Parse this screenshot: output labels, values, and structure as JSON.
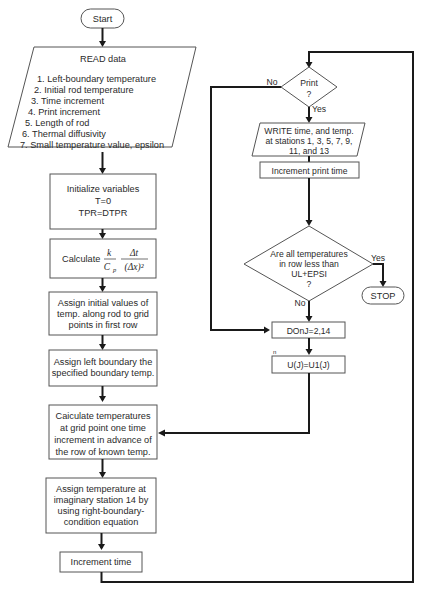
{
  "flowchart": {
    "start": "Start",
    "read": {
      "title": "READ data",
      "items": [
        "1.  Left-boundary temperature",
        "2.  Initial rod temperature",
        "3.  Time increment",
        "4.  Print increment",
        "5.  Length of rod",
        "6.  Thermal diffusivity",
        "7.  Small temperature value, epsilon"
      ]
    },
    "init": {
      "lines": [
        "Initialize variables",
        "T=0",
        "TPR=DTPR"
      ]
    },
    "calculate": {
      "label": "Calculate",
      "k": "k",
      "cp": "C",
      "cp_sub": "p",
      "dt": "Δt",
      "dx2": "(Δx)²"
    },
    "assign_initial": {
      "lines": [
        "Assign initial values of",
        "temp. along rod to grid",
        "points in first row"
      ]
    },
    "assign_left": {
      "lines": [
        "Assign left boundary the",
        "specified boundary temp."
      ]
    },
    "calc_temps": {
      "lines": [
        "Caiculate temperatures",
        "at grid point one time",
        "increment in advance of",
        "the row of known temp."
      ]
    },
    "assign_station": {
      "lines": [
        "Assign temperature at",
        "imaginary station 14 by",
        "using right-boundary-",
        "condition equation"
      ]
    },
    "increment_time": "Increment time",
    "print_decision": {
      "lines": [
        "Print",
        "?"
      ],
      "no": "No",
      "yes": "Yes"
    },
    "write": {
      "lines": [
        "WRITE time, and temp.",
        "at stations 1, 3, 5, 7, 9,",
        "11, and 13"
      ]
    },
    "increment_print": "Increment print time",
    "temps_decision": {
      "lines": [
        "Are all temperatures",
        "in row less than",
        "UL+EPSI",
        "?"
      ],
      "yes": "Yes",
      "no": "No"
    },
    "stop": "STOP",
    "do_loop": "DOnJ=2,14",
    "do_mark": "n",
    "assign_u": "U(J)=U1(J)"
  }
}
